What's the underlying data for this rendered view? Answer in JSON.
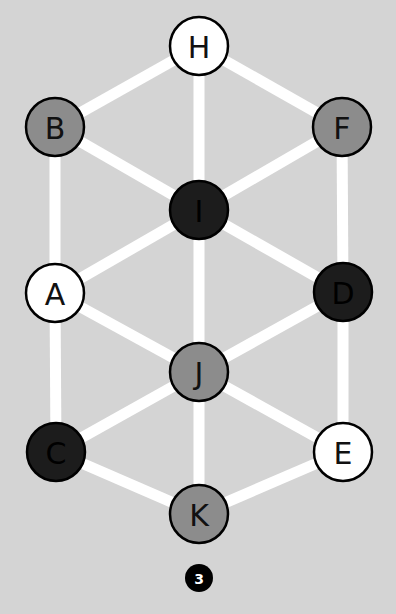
{
  "diagram": {
    "background": "#d4d4d4",
    "edge_color": "#ffffff",
    "edge_width": 11,
    "node_radius": 29,
    "fills": {
      "white": "#ffffff",
      "gray": "#8c8c8c",
      "black": "#1c1c1c"
    },
    "nodes": [
      {
        "id": "H",
        "label": "H",
        "x": 199,
        "y": 46,
        "fill": "white"
      },
      {
        "id": "B",
        "label": "B",
        "x": 55,
        "y": 127,
        "fill": "gray"
      },
      {
        "id": "F",
        "label": "F",
        "x": 342,
        "y": 127,
        "fill": "gray"
      },
      {
        "id": "I",
        "label": "I",
        "x": 199,
        "y": 210,
        "fill": "black"
      },
      {
        "id": "A",
        "label": "A",
        "x": 55,
        "y": 293,
        "fill": "white"
      },
      {
        "id": "D",
        "label": "D",
        "x": 343,
        "y": 292,
        "fill": "black"
      },
      {
        "id": "J",
        "label": "J",
        "x": 199,
        "y": 372,
        "fill": "gray"
      },
      {
        "id": "C",
        "label": "C",
        "x": 56,
        "y": 452,
        "fill": "black"
      },
      {
        "id": "E",
        "label": "E",
        "x": 343,
        "y": 452,
        "fill": "white"
      },
      {
        "id": "K",
        "label": "K",
        "x": 199,
        "y": 514,
        "fill": "gray"
      }
    ],
    "edges": [
      [
        "H",
        "B"
      ],
      [
        "H",
        "F"
      ],
      [
        "H",
        "I"
      ],
      [
        "B",
        "I"
      ],
      [
        "F",
        "I"
      ],
      [
        "B",
        "A"
      ],
      [
        "F",
        "D"
      ],
      [
        "I",
        "A"
      ],
      [
        "I",
        "D"
      ],
      [
        "I",
        "J"
      ],
      [
        "A",
        "J"
      ],
      [
        "D",
        "J"
      ],
      [
        "A",
        "C"
      ],
      [
        "D",
        "E"
      ],
      [
        "J",
        "C"
      ],
      [
        "J",
        "E"
      ],
      [
        "J",
        "K"
      ],
      [
        "C",
        "K"
      ],
      [
        "E",
        "K"
      ]
    ],
    "badge": {
      "label": "3",
      "x": 199,
      "y": 578,
      "r": 14,
      "fill": "#000000",
      "text_color": "#ffffff"
    }
  }
}
